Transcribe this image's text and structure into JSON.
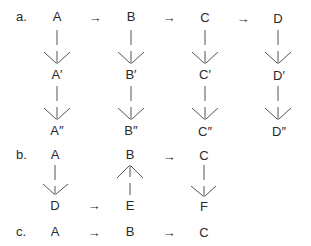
{
  "diagram": {
    "arrow_glyph": "→",
    "a": {
      "label": "a.",
      "top": [
        "A",
        "B",
        "C",
        "D"
      ],
      "prime": [
        "A′",
        "B′",
        "C′",
        "D′"
      ],
      "double_prime": [
        "A″",
        "B″",
        "C″",
        "D″"
      ]
    },
    "b": {
      "label": "b.",
      "top": [
        "A",
        "B",
        "C"
      ],
      "bottom": [
        "D",
        "E",
        "F"
      ]
    },
    "c": {
      "label": "c.",
      "nodes": [
        "A",
        "B",
        "C"
      ]
    }
  }
}
